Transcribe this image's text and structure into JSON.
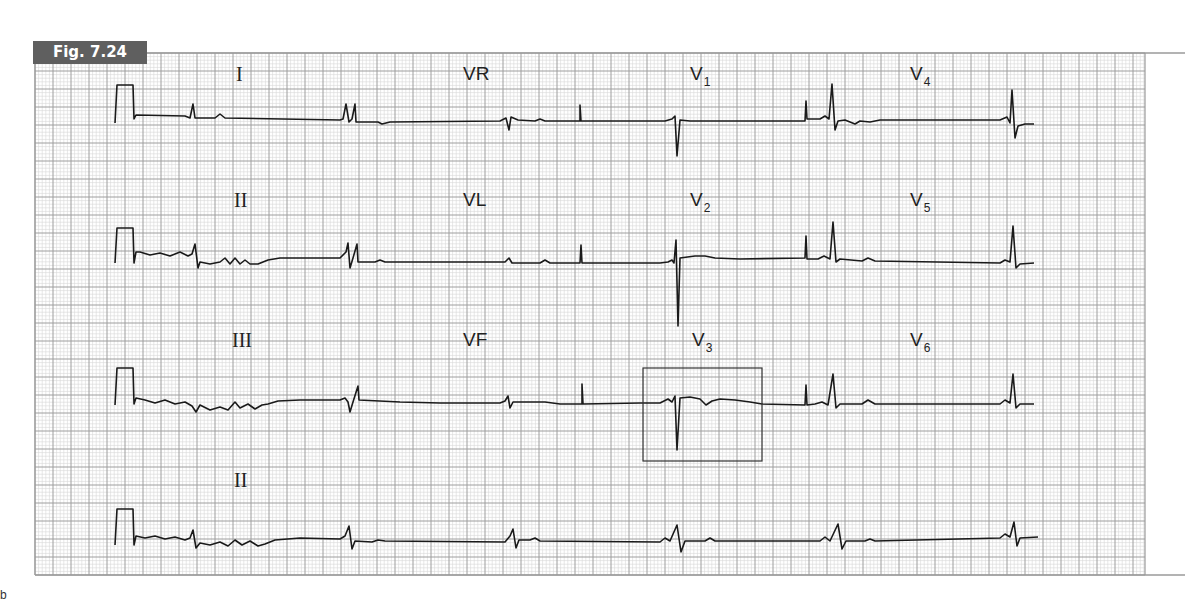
{
  "figure": {
    "badge_label": "Fig. 7.24",
    "corner_mark": "b"
  },
  "grid": {
    "x": 35,
    "y": 53,
    "width": 1110,
    "height": 522,
    "minor_step": 3.6,
    "major_step": 18,
    "minor_color": "#d6d6d6",
    "major_color": "#9e9e9e",
    "border_color": "#9a9a9a",
    "border_extend_to": 1185
  },
  "leads": [
    {
      "name": "I",
      "base": "I",
      "sub": "",
      "style": "roman",
      "x": 236,
      "y": 64
    },
    {
      "name": "VR",
      "base": "VR",
      "sub": "",
      "style": "sans",
      "x": 463,
      "y": 64
    },
    {
      "name": "V1",
      "base": "V",
      "sub": "1",
      "style": "sans",
      "x": 690,
      "y": 64
    },
    {
      "name": "V4",
      "base": "V",
      "sub": "4",
      "style": "sans",
      "x": 910,
      "y": 64
    },
    {
      "name": "II",
      "base": "II",
      "sub": "",
      "style": "roman",
      "x": 234,
      "y": 190
    },
    {
      "name": "VL",
      "base": "VL",
      "sub": "",
      "style": "sans",
      "x": 463,
      "y": 190
    },
    {
      "name": "V2",
      "base": "V",
      "sub": "2",
      "style": "sans",
      "x": 690,
      "y": 190
    },
    {
      "name": "V5",
      "base": "V",
      "sub": "5",
      "style": "sans",
      "x": 910,
      "y": 190
    },
    {
      "name": "III",
      "base": "III",
      "sub": "",
      "style": "roman",
      "x": 232,
      "y": 330
    },
    {
      "name": "VF",
      "base": "VF",
      "sub": "",
      "style": "sans",
      "x": 463,
      "y": 330
    },
    {
      "name": "V3",
      "base": "V",
      "sub": "3",
      "style": "sans",
      "x": 692,
      "y": 330
    },
    {
      "name": "V6",
      "base": "V",
      "sub": "6",
      "style": "sans",
      "x": 910,
      "y": 330
    },
    {
      "name": "II-rhythm",
      "base": "II",
      "sub": "",
      "style": "roman",
      "x": 234,
      "y": 470
    }
  ],
  "highlight_box": {
    "x": 643,
    "y": 368,
    "width": 119,
    "height": 93,
    "color": "#333333"
  },
  "trace_color": "#1a1a1a",
  "rows": [
    {
      "baseline": 116,
      "segments": [
        "M115,123 L117,85 L133,85 L134,119 L136,115 L185,116 L190,118 L193,104 L195,118 L215,118 L220,114 L225,118 L340,120 L343,119 L346,104 L349,122 L352,119 L355,104 L356,122 L378,122 L382,124 L390,122 L500,121 L506,118 L509,130 L511,117 L518,120 L535,121 L540,119 L545,121 L580,121 L580,105 L581,121 L665,121 L672,119 L675,116 L677,156 L680,120 L690,121 L805,121 L806,101 L807,119 L820,119 L825,116 L829,119 L832,84 L835,130 L838,121 L845,120 L855,124 L860,121 L870,122 L880,120 L1000,120 L1007,117 L1010,123 L1012,90 L1015,138 L1018,126 L1025,124 L1034,124"
      ]
    },
    {
      "baseline": 262,
      "segments": [
        "M115,263 L117,228 L133,228 L134,263 L136,252 L140,252 L150,255 L160,253 L170,256 L180,252 L188,256 L192,254 L195,244 L198,268 L200,262 L210,264 L220,262 L225,258 L230,264 L235,258 L240,264 L245,260 L250,264 L258,264 L268,260 L280,258 L340,258 L346,252 L348,243 L350,268 L353,258 L357,244 L358,262 L375,262 L380,260 L385,262 L505,262 L509,258 L512,263 L520,263 L540,263 L545,260 L550,263 L580,263 L581,245 L582,263 L660,263 L668,262 L672,260 L674,263 L676,240 L678,326 L680,258 L695,256 L705,256 L715,258 L740,259 L805,258 L806,236 L807,259 L818,259 L824,256 L830,259 L833,222 L836,262 L840,259 L862,261 L868,258 L875,261 L1000,263 L1005,260 L1010,262 L1013,226 L1016,268 L1020,264 L1034,263"
      ]
    },
    {
      "baseline": 403,
      "segments": [
        "M115,405 L117,368 L133,368 L134,404 L136,398 L145,400 L155,403 L165,400 L175,404 L185,402 L192,406 L196,412 L200,405 L210,410 L220,407 L228,410 L235,402 L240,408 L248,404 L255,409 L262,405 L268,404 L278,401 L300,400 L340,400 L345,398 L348,402 L350,412 L353,402 L358,386 L359,400 L400,402 L440,403 L500,403 L505,401 L508,396 L510,408 L513,402 L530,402 L545,402 L560,404 L582,404 L582,384 L583,404 L640,403 L660,403 L668,399 L672,402 L675,396 L677,450 L680,398 L690,397 L700,399 L706,405 L712,401 L720,399 L735,400 L750,402 L762,404 L805,405 L806,385 L807,405 L815,404 L822,402 L828,405 L833,374 L836,408 L840,404 L862,404 L868,400 L875,404 L1000,404 L1005,400 L1010,403 L1013,374 L1016,408 L1020,404 L1034,404"
      ]
    },
    {
      "baseline": 541,
      "segments": [
        "M115,545 L117,509 L133,509 L134,545 L136,536 L145,538 L155,536 L165,539 L175,537 L185,540 L190,538 L193,530 L196,548 L200,543 L210,545 L220,542 L228,546 L235,540 L242,545 L250,541 L258,546 L265,544 L275,540 L300,538 L340,539 L345,536 L349,526 L352,549 L355,541 L372,542 L378,540 L385,541 L505,542 L510,536 L513,529 L516,548 L519,540 L530,540 L535,538 L540,541 L660,542 L665,538 L670,541 L677,525 L681,552 L685,541 L705,541 L710,538 L715,541 L820,541 L825,537 L830,541 L838,524 L842,549 L846,541 L865,541 L870,539 L875,541 L1000,538 L1005,534 L1010,537 L1014,522 L1017,546 L1020,538 L1038,537"
      ]
    }
  ]
}
